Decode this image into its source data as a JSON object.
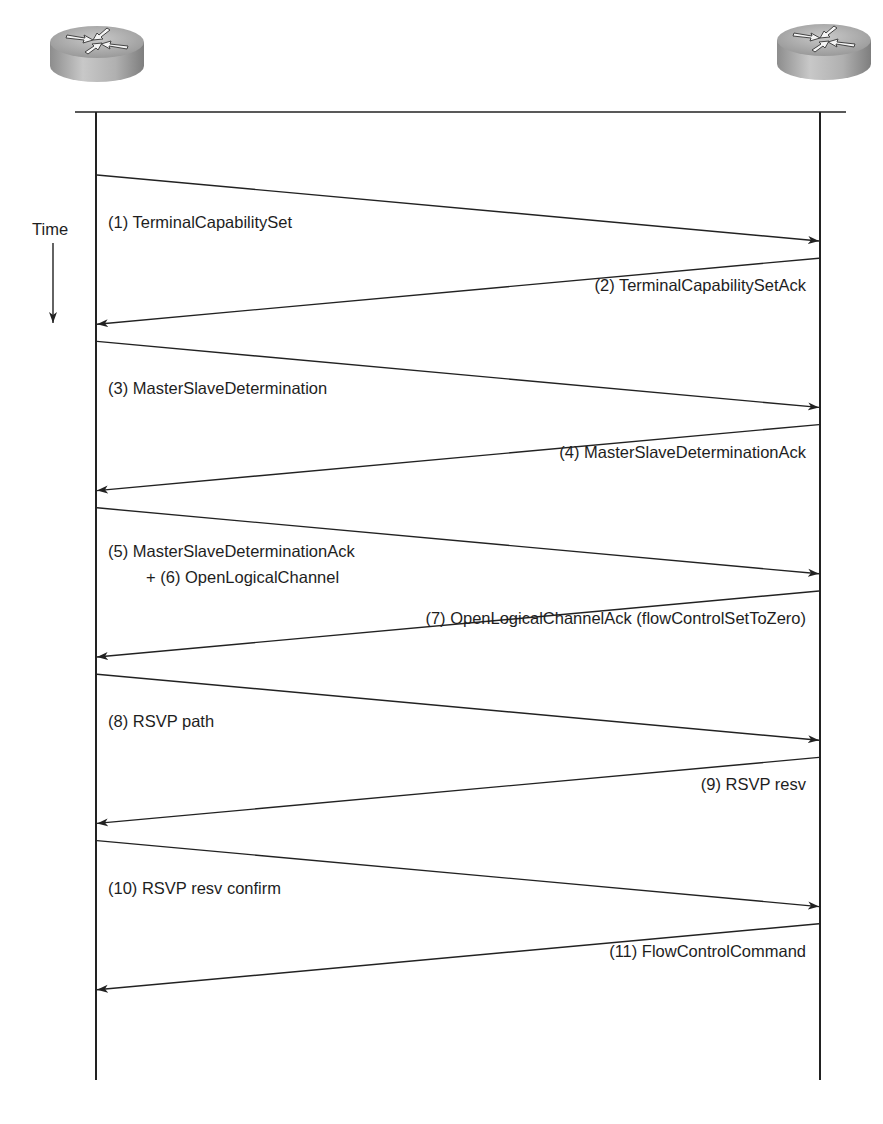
{
  "diagram": {
    "type": "sequence",
    "time_label": "Time",
    "participants": [
      {
        "id": "left",
        "icon": "router-icon"
      },
      {
        "id": "right",
        "icon": "router-icon"
      }
    ],
    "messages": [
      {
        "from": "left",
        "to": "right",
        "label": "(1) TerminalCapabilitySet"
      },
      {
        "from": "right",
        "to": "left",
        "label": "(2) TerminalCapabilitySetAck"
      },
      {
        "from": "left",
        "to": "right",
        "label": "(3) MasterSlaveDetermination"
      },
      {
        "from": "right",
        "to": "left",
        "label": "(4) MasterSlaveDeterminationAck"
      },
      {
        "from": "left",
        "to": "right",
        "label": "(5) MasterSlaveDeterminationAck",
        "label2": "+ (6) OpenLogicalChannel"
      },
      {
        "from": "right",
        "to": "left",
        "label": "(7) OpenLogicalChannelAck (flowControlSetToZero)"
      },
      {
        "from": "left",
        "to": "right",
        "label": "(8) RSVP path"
      },
      {
        "from": "right",
        "to": "left",
        "label": "(9) RSVP resv"
      },
      {
        "from": "left",
        "to": "right",
        "label": "(10) RSVP resv confirm"
      },
      {
        "from": "right",
        "to": "left",
        "label": "(11) FlowControlCommand"
      }
    ]
  }
}
